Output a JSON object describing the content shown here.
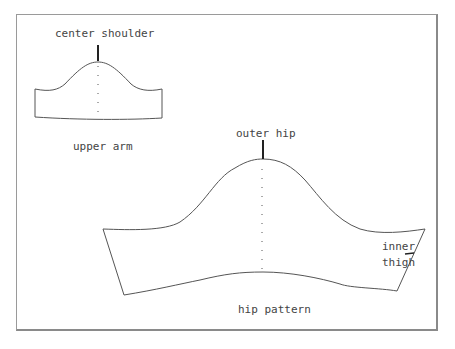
{
  "diagram": {
    "upper_arm": {
      "caption": "upper arm",
      "marker_label": "center shoulder"
    },
    "hip": {
      "caption": "hip pattern",
      "marker_label": "outer hip",
      "side_label_line1": "inner",
      "side_label_line2": "thigh"
    },
    "colors": {
      "line": "#555555",
      "frame": "#9a9a9a",
      "text": "#444444"
    }
  }
}
